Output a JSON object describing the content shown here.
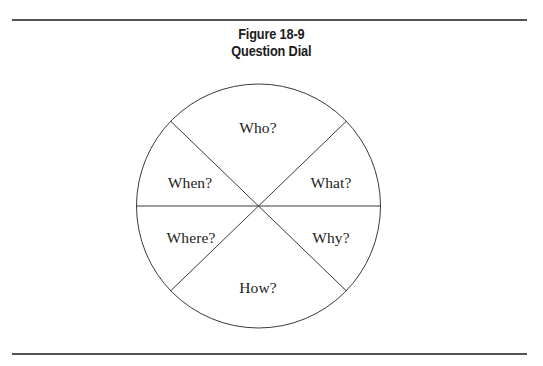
{
  "page": {
    "width": 543,
    "height": 366,
    "background": "#ffffff",
    "rule_color": "#53535a"
  },
  "caption": {
    "line1": "Figure 18-9",
    "line2": "Question Dial"
  },
  "diagram": {
    "kind": "pie-sector-diagram",
    "title": "Question Dial",
    "stroke_color": "#3a3a3a",
    "center_x": 258.5,
    "center_y": 206,
    "radius": 122,
    "divider_angles_deg": [
      0,
      44,
      136
    ],
    "sectors": [
      {
        "name": "who",
        "label": "Who?",
        "label_x": 258,
        "label_y": 128
      },
      {
        "name": "what",
        "label": "What?",
        "label_x": 331,
        "label_y": 183
      },
      {
        "name": "why",
        "label": "Why?",
        "label_x": 331,
        "label_y": 238
      },
      {
        "name": "how",
        "label": "How?",
        "label_x": 258,
        "label_y": 288
      },
      {
        "name": "where",
        "label": "Where?",
        "label_x": 191,
        "label_y": 238
      },
      {
        "name": "when",
        "label": "When?",
        "label_x": 190,
        "label_y": 183
      }
    ]
  },
  "chart_data": {
    "type": "pie",
    "title": "Question Dial",
    "categories": [
      "Who?",
      "What?",
      "Why?",
      "How?",
      "Where?",
      "When?"
    ],
    "values": [
      92,
      44,
      44,
      92,
      44,
      44
    ],
    "value_unit": "degrees",
    "legend": "none",
    "grid": false,
    "xlabel": "",
    "ylabel": ""
  }
}
